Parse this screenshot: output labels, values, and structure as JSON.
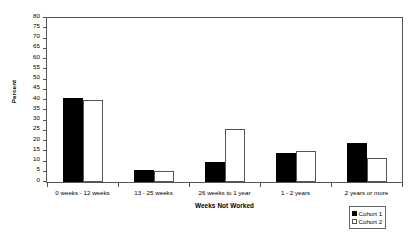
{
  "chart_data": {
    "type": "bar",
    "title": "",
    "xlabel": "Weeks Not Worked",
    "ylabel": "Percent",
    "categories": [
      "0 weeks - 12 weeks",
      "13 - 25 weeks",
      "26 weeks to 1 year",
      "1 - 2 years",
      "2 years or more"
    ],
    "series": [
      {
        "name": "Cohort 1",
        "color": "#000000",
        "values": [
          41,
          6,
          10,
          14,
          19
        ]
      },
      {
        "name": "Cohort 2",
        "color": "#ffffff",
        "values": [
          40,
          5.5,
          26,
          15,
          11.5
        ]
      }
    ],
    "ylim": [
      0,
      80
    ],
    "ytick_step": 5,
    "yticks": [
      0,
      5,
      10,
      15,
      20,
      25,
      30,
      35,
      40,
      45,
      50,
      55,
      60,
      65,
      70,
      75,
      80
    ],
    "ytick_labels": [
      "0",
      "5",
      "10",
      "15",
      "20",
      "25",
      "30",
      "35",
      "40",
      "45",
      "50",
      "55",
      "60",
      "65",
      "70",
      "75",
      "80"
    ],
    "grid": false,
    "legend_position": "bottom-right",
    "legend_entries": [
      "Cohort 1",
      "Cohort 2"
    ]
  },
  "axes": {
    "y_title": "Percent",
    "x_title": "Weeks Not Worked"
  },
  "legend": {
    "items": [
      {
        "label": "Cohort 1"
      },
      {
        "label": "Cohort 2"
      }
    ]
  }
}
